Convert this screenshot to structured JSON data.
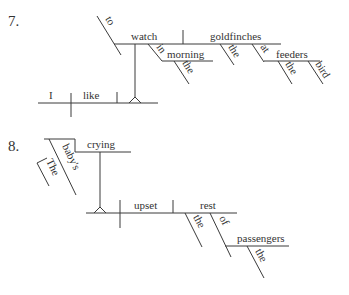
{
  "diagrams": [
    {
      "number": "7.",
      "sentence_words": {
        "subject": "I",
        "verb": "like",
        "infinitive_marker": "to",
        "infinitive_verb": "watch",
        "object": "goldfinches",
        "prep_in": "in",
        "prep_in_object": "morning",
        "prep_in_article": "the",
        "object_article": "the",
        "prep_at": "at",
        "prep_at_object": "feeders",
        "feeders_article": "the",
        "feeders_modifier": "bird"
      }
    },
    {
      "number": "8.",
      "sentence_words": {
        "gerund": "crying",
        "possessive": "baby's",
        "possessive_article": "The",
        "verb": "upset",
        "object": "rest",
        "object_article": "the",
        "prep_of": "of",
        "prep_of_object": "passengers",
        "passengers_article": "the"
      }
    }
  ],
  "colors": {
    "line": "#3a3a3a",
    "text": "#333333",
    "background": "#ffffff"
  }
}
